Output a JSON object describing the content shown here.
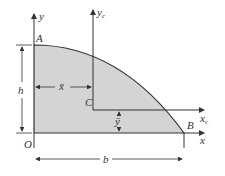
{
  "diagram": {
    "labels": {
      "y_axis": "y",
      "yc_axis": "y",
      "yc_sub": "c",
      "x_axis": "x",
      "xc_axis": "x",
      "xc_sub": "c",
      "point_a": "A",
      "point_b": "B",
      "point_o": "O",
      "point_c": "C",
      "height": "h",
      "base": "b",
      "xbar": "x̄",
      "ybar": "ȳ"
    },
    "colors": {
      "fill": "#d4d4d4",
      "stroke": "#333333"
    }
  }
}
